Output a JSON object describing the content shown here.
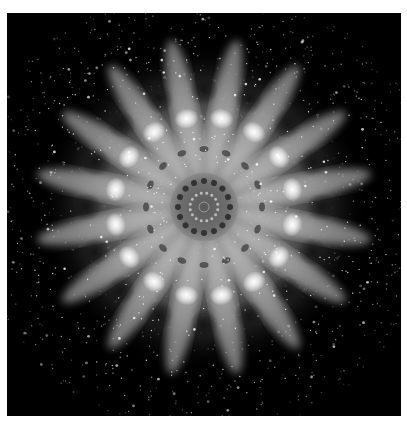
{
  "image": {
    "description": "Grayscale radially symmetric fractal mandala on black background",
    "symmetry_order": 16,
    "colors": {
      "background": "#000000",
      "border": "#ffffff",
      "glow": "#ffffff",
      "core": "#6e6e6e"
    }
  }
}
